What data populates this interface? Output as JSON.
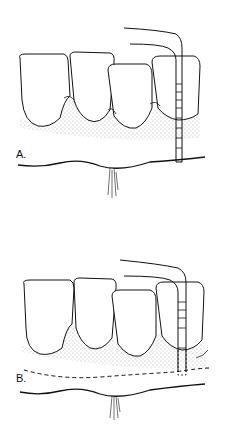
{
  "figure": {
    "panels": [
      {
        "label": "A.",
        "description": "Periodontal probe measuring pocket depth at gingival margin"
      },
      {
        "label": "B.",
        "description": "Periodontal probe measuring attachment level with bone crest shown as dashed line"
      }
    ],
    "colors": {
      "line": "#111111",
      "stipple": "#555555",
      "background": "#ffffff"
    }
  }
}
